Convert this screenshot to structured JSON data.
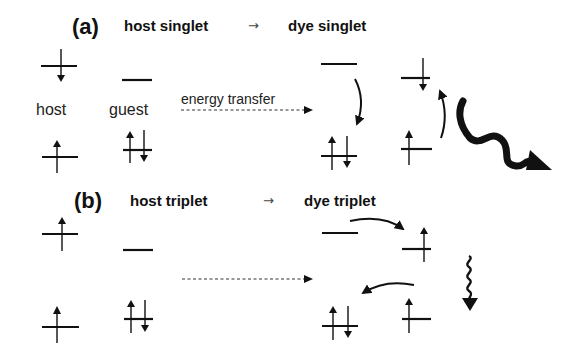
{
  "panels": [
    {
      "id": "a",
      "label": "(a)",
      "from": "host singlet",
      "arrow": "→",
      "to": "dye singlet",
      "host_label": "host",
      "guest_label": "guest",
      "transfer_label": "energy transfer",
      "emission": "fluorescence (large wavy arrow)"
    },
    {
      "id": "b",
      "label": "(b)",
      "from": "host triplet",
      "arrow": "→",
      "to": "dye triplet",
      "transfer_label": "",
      "emission": "phosphorescence (small wavy arrow)"
    }
  ],
  "colors": {
    "ink": "#111111",
    "background": "#ffffff"
  }
}
